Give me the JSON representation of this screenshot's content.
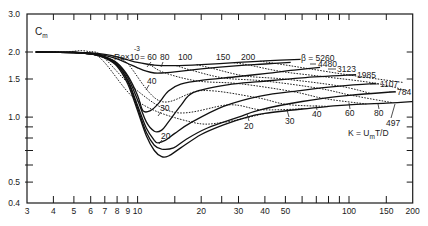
{
  "chart_data": {
    "type": "line",
    "title": "",
    "xlabel": "K = U_m T/D",
    "ylabel": "C_m",
    "xscale": "log",
    "yscale": "log",
    "xlim": [
      3,
      200
    ],
    "ylim": [
      0.4,
      3.0
    ],
    "grid": false,
    "x_ticks": [
      3,
      4,
      5,
      6,
      7,
      8,
      9,
      10,
      15,
      20,
      25,
      30,
      40,
      50,
      60,
      70,
      80,
      90,
      100,
      150,
      200
    ],
    "x_tick_labels": [
      {
        "v": 3,
        "t": "3"
      },
      {
        "v": 4,
        "t": "4"
      },
      {
        "v": 5,
        "t": "5"
      },
      {
        "v": 6,
        "t": "6"
      },
      {
        "v": 7,
        "t": "7"
      },
      {
        "v": 8,
        "t": "8"
      },
      {
        "v": 9,
        "t": "9"
      },
      {
        "v": 10,
        "t": "10"
      },
      {
        "v": 20,
        "t": "20"
      },
      {
        "v": 30,
        "t": "30"
      },
      {
        "v": 40,
        "t": "40"
      },
      {
        "v": 50,
        "t": "50"
      },
      {
        "v": 100,
        "t": "100"
      },
      {
        "v": 150,
        "t": "150"
      },
      {
        "v": 200,
        "t": "200"
      }
    ],
    "y_ticks": [
      0.4,
      0.5,
      0.6,
      0.7,
      0.8,
      0.9,
      1.0,
      1.5,
      2.0,
      3.0
    ],
    "y_tick_labels": [
      {
        "v": 3.0,
        "t": "3.0"
      },
      {
        "v": 2.0,
        "t": "2.0"
      },
      {
        "v": 1.5,
        "t": "1.5"
      },
      {
        "v": 1.0,
        "t": "1.0"
      },
      {
        "v": 0.5,
        "t": "0.5"
      },
      {
        "v": 0.4,
        "t": "0.4"
      }
    ],
    "series": [
      {
        "name": "β = 5260",
        "beta": 5260,
        "style": "solid",
        "K": [
          3.3,
          5,
          6,
          7,
          8,
          9,
          10,
          11,
          12,
          13,
          15,
          20,
          30,
          40,
          59
        ],
        "Cm": [
          2.0,
          1.995,
          1.98,
          1.95,
          1.9,
          1.84,
          1.79,
          1.76,
          1.74,
          1.73,
          1.73,
          1.75,
          1.79,
          1.82,
          1.85
        ]
      },
      {
        "name": "4480",
        "beta": 4480,
        "style": "solid",
        "K": [
          3.3,
          5,
          6,
          7,
          8,
          9,
          10,
          11,
          12,
          13,
          15,
          20,
          30,
          40,
          53
        ],
        "Cm": [
          2.0,
          1.995,
          1.97,
          1.93,
          1.86,
          1.77,
          1.69,
          1.63,
          1.6,
          1.6,
          1.62,
          1.67,
          1.73,
          1.76,
          1.79
        ]
      },
      {
        "name": "3123",
        "beta": 3123,
        "style": "solid",
        "K": [
          3.3,
          5,
          6,
          7,
          8,
          9,
          10,
          10.6,
          11.5,
          12.5,
          14,
          16,
          20,
          30,
          40,
          55,
          73
        ],
        "Cm": [
          2.0,
          1.99,
          1.96,
          1.9,
          1.78,
          1.55,
          1.26,
          1.07,
          1.07,
          1.15,
          1.32,
          1.42,
          1.48,
          1.54,
          1.59,
          1.65,
          1.7
        ]
      },
      {
        "name": "1985",
        "beta": 1985,
        "style": "solid",
        "K": [
          3.3,
          5,
          6,
          7,
          8,
          9,
          10,
          11,
          12,
          13,
          14,
          16,
          18.4,
          26.6,
          38,
          60,
          108
        ],
        "Cm": [
          2.0,
          1.99,
          1.96,
          1.9,
          1.77,
          1.52,
          1.2,
          0.95,
          0.86,
          0.87,
          0.95,
          1.13,
          1.3,
          1.41,
          1.46,
          1.52,
          1.57
        ]
      },
      {
        "name": "1107",
        "beta": 1107,
        "style": "solid",
        "K": [
          3.3,
          5,
          6,
          7,
          8,
          9,
          10,
          11,
          12,
          12.5,
          13.5,
          15,
          17.8,
          25.5,
          38,
          60,
          90,
          134
        ],
        "Cm": [
          2.0,
          1.99,
          1.96,
          1.89,
          1.75,
          1.48,
          1.13,
          0.89,
          0.78,
          0.76,
          0.78,
          0.84,
          0.94,
          1.12,
          1.25,
          1.33,
          1.39,
          1.43
        ]
      },
      {
        "name": "784",
        "beta": 784,
        "style": "solid",
        "K": [
          3.3,
          5,
          6,
          7,
          8,
          9,
          10,
          11,
          12,
          13,
          14.8,
          17,
          21.4,
          30,
          38,
          60,
          100,
          166
        ],
        "Cm": [
          2.0,
          1.99,
          1.96,
          1.88,
          1.74,
          1.46,
          1.1,
          0.85,
          0.74,
          0.71,
          0.72,
          0.79,
          0.89,
          1.0,
          1.08,
          1.18,
          1.26,
          1.31
        ]
      },
      {
        "name": "497",
        "beta": 497,
        "style": "solid",
        "K": [
          3.3,
          5,
          6,
          7,
          8,
          9,
          10,
          11,
          12,
          13,
          14,
          16,
          20,
          25.5,
          33,
          40,
          60,
          80,
          100,
          150,
          200
        ],
        "Cm": [
          2.0,
          1.99,
          1.96,
          1.88,
          1.72,
          1.42,
          1.07,
          0.82,
          0.7,
          0.655,
          0.66,
          0.72,
          0.83,
          0.92,
          1.0,
          1.04,
          1.09,
          1.12,
          1.14,
          1.16,
          1.18
        ]
      }
    ],
    "re_lines": {
      "description": "dashed lines of constant Re x 10^-3 (Re = beta * K)",
      "style": "dashed",
      "values": [
        20,
        30,
        40,
        60,
        80,
        100,
        150,
        200
      ]
    },
    "annotations": {
      "re_prefix": "Re×10",
      "re_exponent": "-3",
      "re_top_first": "= 60",
      "re_top": [
        "80",
        "100",
        "150",
        "200"
      ],
      "re_mid": [
        "40",
        "30",
        "20"
      ],
      "re_bottom": [
        "20",
        "30",
        "40",
        "60",
        "80"
      ],
      "beta_labels": [
        "β = 5260",
        "4480",
        "3123",
        "1985",
        "1107",
        "784",
        "497"
      ]
    },
    "ylabel_main": "C",
    "ylabel_sub": "m",
    "xlabel_pre": "K = U",
    "xlabel_sub": "m",
    "xlabel_post": "T/D"
  }
}
